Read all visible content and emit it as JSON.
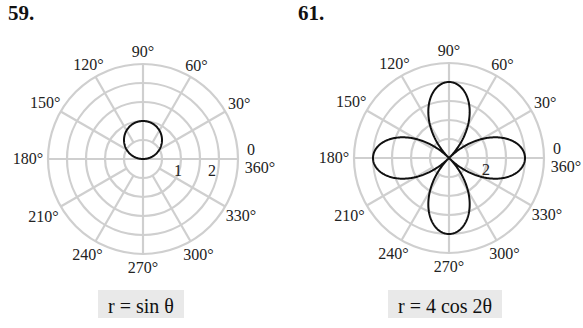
{
  "problems": [
    {
      "number": "59.",
      "caption": "r = sin θ"
    },
    {
      "number": "61.",
      "caption": "r = 4 cos 2θ"
    }
  ],
  "chart_data": [
    {
      "type": "polar",
      "title": "59.",
      "equation": "r = sin θ",
      "angle_labels": [
        "0 / 360°",
        "30°",
        "60°",
        "90°",
        "120°",
        "150°",
        "180°",
        "210°",
        "240°",
        "270°",
        "300°",
        "330°"
      ],
      "radial_tick_labels": [
        "1",
        "2"
      ],
      "rings": 5,
      "ring_step": 0.5,
      "curve": {
        "fn": "sin",
        "a": 1,
        "k": 1,
        "description": "circle of diameter 1 centered at (0, 0.5)"
      },
      "grid": true
    },
    {
      "type": "polar",
      "title": "61.",
      "equation": "r = 4 cos 2θ",
      "angle_labels": [
        "0 / 360°",
        "30°",
        "60°",
        "90°",
        "120°",
        "150°",
        "180°",
        "210°",
        "240°",
        "270°",
        "300°",
        "330°"
      ],
      "radial_tick_labels": [
        "2"
      ],
      "rings": 5,
      "ring_step": 1,
      "curve": {
        "fn": "cos",
        "a": 4,
        "k": 2,
        "description": "four-petal rose, petal tips at r=4 on 0°, 90°, 180°, 270°"
      },
      "grid": true
    }
  ]
}
